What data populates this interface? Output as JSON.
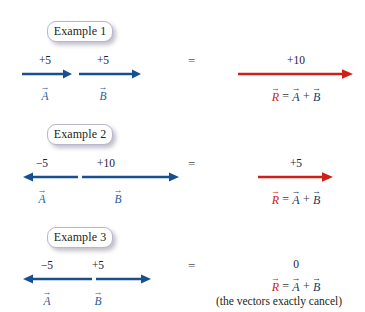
{
  "figure": {
    "colors": {
      "vector_blue": "#16508f",
      "label_blue": "#1f5d9e",
      "resultant_red": "#cf2017",
      "text_dark": "#231f20",
      "badge_border": "#b9b5cc"
    }
  },
  "examples": [
    {
      "badge": "Example 1",
      "equals": "=",
      "vectors": [
        {
          "name": "A",
          "label": "⃗A",
          "magnitude": "+5",
          "direction": "right"
        },
        {
          "name": "B",
          "label": "⃗B",
          "magnitude": "+5",
          "direction": "right"
        }
      ],
      "result": {
        "magnitude": "+10",
        "equation_r": "R",
        "equation_eq": "=",
        "equation_a": "A",
        "equation_plus": "+",
        "equation_b": "B",
        "direction": "right"
      },
      "note": ""
    },
    {
      "badge": "Example 2",
      "equals": "=",
      "vectors": [
        {
          "name": "A",
          "label": "⃗A",
          "magnitude": "−5",
          "direction": "left"
        },
        {
          "name": "B",
          "label": "⃗B",
          "magnitude": "+10",
          "direction": "right"
        }
      ],
      "result": {
        "magnitude": "+5",
        "equation_r": "R",
        "equation_eq": "=",
        "equation_a": "A",
        "equation_plus": "+",
        "equation_b": "B",
        "direction": "right"
      },
      "note": ""
    },
    {
      "badge": "Example 3",
      "equals": "=",
      "vectors": [
        {
          "name": "A",
          "label": "⃗A",
          "magnitude": "−5",
          "direction": "left"
        },
        {
          "name": "B",
          "label": "⃗B",
          "magnitude": "+5",
          "direction": "right"
        }
      ],
      "result": {
        "magnitude": "0",
        "equation_r": "R",
        "equation_eq": "=",
        "equation_a": "A",
        "equation_plus": "+",
        "equation_b": "B",
        "direction": "none"
      },
      "note": "(the vectors exactly cancel)"
    }
  ]
}
